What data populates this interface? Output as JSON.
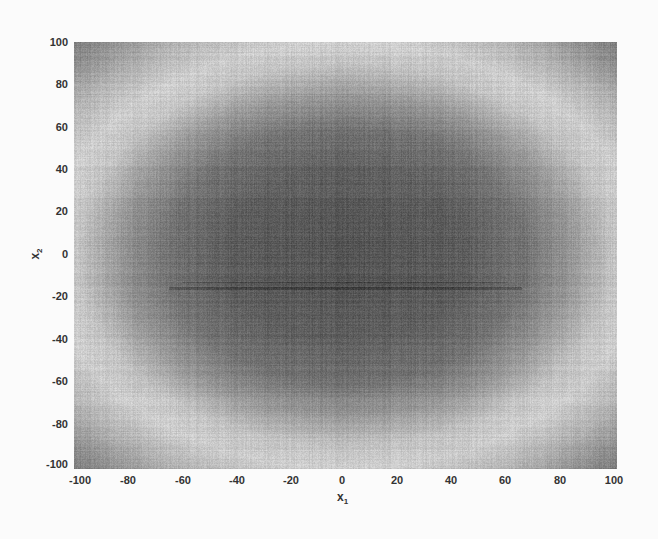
{
  "chart_data": {
    "type": "heatmap",
    "title": "",
    "xlabel": "x",
    "xlabel_subscript": "1",
    "ylabel": "x",
    "ylabel_subscript": "2",
    "xlim": [
      -100,
      100
    ],
    "ylim": [
      -100,
      100
    ],
    "xticks": [
      -100,
      -80,
      -60,
      -40,
      -20,
      0,
      20,
      40,
      60,
      80,
      100
    ],
    "yticks": [
      100,
      80,
      60,
      40,
      20,
      0,
      -20,
      -40,
      -60,
      -80,
      -100
    ],
    "xtick_labels": [
      "-100",
      "-80",
      "-60",
      "-40",
      "-20",
      "0",
      "20",
      "40",
      "60",
      "80",
      "100"
    ],
    "ytick_labels": [
      "100",
      "80",
      "60",
      "40",
      "20",
      "0",
      "-20",
      "-40",
      "-60",
      "-80",
      "-100"
    ],
    "grid": false,
    "legend": null,
    "colormap": "grayscale",
    "radial_profile": {
      "radius": [
        0,
        20,
        40,
        60,
        75,
        90,
        100,
        115,
        130,
        141
      ],
      "intensity_gray": [
        85,
        88,
        95,
        115,
        150,
        195,
        205,
        175,
        135,
        110
      ]
    },
    "ellipse_aspect": 1.1,
    "center": [
      0,
      0
    ],
    "streak_y": -15,
    "colors": {
      "dark": "#555555",
      "light": "#d2d2d2",
      "text": "#333333",
      "background": "#fbfbfb"
    }
  }
}
